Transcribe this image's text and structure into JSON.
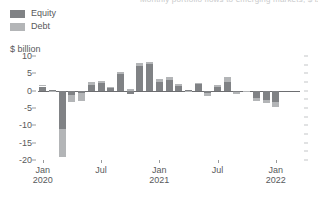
{
  "title_clipped": "Monthly portfolio flows to emerging markets, $ billion",
  "legend": {
    "items": [
      {
        "label": "Equity",
        "color": "#808285",
        "name": "legend-equity"
      },
      {
        "label": "Debt",
        "color": "#b3b5b7",
        "name": "legend-debt"
      }
    ]
  },
  "axis_unit": "$ billion",
  "chart_data": {
    "type": "bar",
    "stacked": true,
    "title": "",
    "subtitle": "",
    "xlabel": "",
    "ylabel": "$ billion",
    "ylim": [
      -20,
      10
    ],
    "yticks": [
      10,
      5,
      0,
      -5,
      -10,
      -15,
      -20
    ],
    "ytick_labels": [
      "10",
      "5",
      "0",
      "-5",
      "-10",
      "-15",
      "-20"
    ],
    "grid": false,
    "legend_position": "top-left",
    "categories": [
      "Jan 2020",
      "Feb 2020",
      "Mar 2020",
      "Apr 2020",
      "May 2020",
      "Jun 2020",
      "Jul 2020",
      "Aug 2020",
      "Sep 2020",
      "Oct 2020",
      "Nov 2020",
      "Dec 2020",
      "Jan 2021",
      "Feb 2021",
      "Mar 2021",
      "Apr 2021",
      "May 2021",
      "Jun 2021",
      "Jul 2021",
      "Aug 2021",
      "Sep 2021",
      "Oct 2021",
      "Nov 2021",
      "Dec 2021",
      "Jan 2022",
      "Feb 2022",
      "Mar 2022"
    ],
    "series": [
      {
        "name": "Equity",
        "color": "#808285",
        "values": [
          1.2,
          0.3,
          -11.0,
          -1.2,
          -0.6,
          1.6,
          2.2,
          0.8,
          4.8,
          -0.9,
          7.2,
          7.8,
          2.6,
          3.0,
          1.4,
          0.2,
          1.8,
          -0.8,
          1.0,
          2.4,
          -0.5,
          -0.2,
          -2.0,
          -2.6,
          -3.4,
          0.0,
          0.0
        ]
      },
      {
        "name": "Debt",
        "color": "#b3b5b7",
        "values": [
          0.4,
          -0.1,
          -8.0,
          -2.0,
          -2.4,
          0.8,
          0.5,
          0.4,
          0.6,
          0.4,
          0.7,
          0.6,
          0.8,
          0.9,
          0.5,
          -0.3,
          0.4,
          -0.6,
          0.7,
          1.4,
          -0.4,
          -0.3,
          -1.1,
          -1.0,
          -1.2,
          0.0,
          0.0
        ]
      }
    ],
    "xtick_labels": [
      {
        "line1": "Jan",
        "line2": "2020",
        "index": 0
      },
      {
        "line1": "Jul",
        "line2": "",
        "index": 6
      },
      {
        "line1": "Jan",
        "line2": "2021",
        "index": 12
      },
      {
        "line1": "Jul",
        "line2": "",
        "index": 18
      },
      {
        "line1": "Jan",
        "line2": "2022",
        "index": 24
      }
    ]
  }
}
